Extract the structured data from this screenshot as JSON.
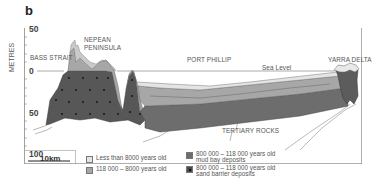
{
  "panel_label": "b",
  "axis": {
    "ylabel": "METRES",
    "ticks": [
      "50",
      "0",
      "50",
      "100"
    ]
  },
  "places": {
    "bass_strait": "BASS STRAIT",
    "nepean_line1": "NEPEAN",
    "nepean_line2": "PENINSULA",
    "port_phillip": "PORT PHILLIP",
    "sea_level": "Sea Level",
    "yarra_delta": "YARRA DELTA",
    "tertiary_rocks": "TERTIARY ROCKS"
  },
  "scale_bar": {
    "label": "10km"
  },
  "legend": [
    {
      "label": "Less than 8000 years old",
      "color": "#e4e4e4"
    },
    {
      "label": "118 000 – 8000 years old",
      "color": "#a7a7a7"
    },
    {
      "label": "800 000 – 118 000 years old mud bay deposits",
      "line1": "800 000 – 118 000 years old",
      "line2": "mud bay deposits",
      "color": "#6d6d6d"
    },
    {
      "label": "800 000 – 118 000 years old sand barrier deposits",
      "line1": "800 000 – 118 000 years old",
      "line2": "sand barrier deposits",
      "color": "#4a4a4a"
    }
  ],
  "colors": {
    "young": "#e4e4e4",
    "mid": "#a7a7a7",
    "mud": "#6d6d6d",
    "sand": "#555555",
    "frame": "#8a8a8a"
  }
}
